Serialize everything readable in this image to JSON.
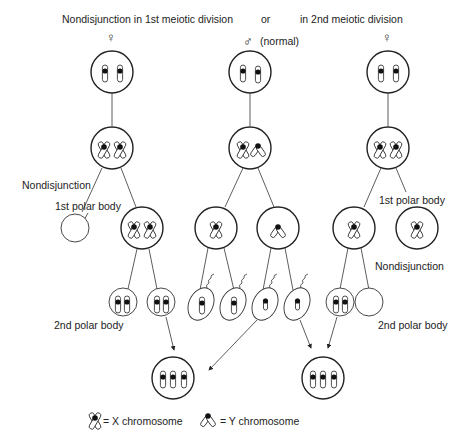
{
  "header": {
    "left_title": "Nondisjunction in 1st meiotic division",
    "or_label": "or",
    "right_title": "in 2nd meiotic division",
    "female_symbol_left": "♀",
    "male_symbol": "♂",
    "male_note": "(normal)",
    "female_symbol_right": "♀"
  },
  "labels": {
    "nondisjunction_left": "Nondisjunction",
    "first_polar_body_left": "1st polar body",
    "second_polar_body_left": "2nd polar body",
    "first_polar_body_right": "1st polar body",
    "nondisjunction_right": "Nondisjunction",
    "second_polar_body_right": "2nd polar body"
  },
  "legend": {
    "x_label": "= X chromosome",
    "y_label": "= Y chromosome"
  },
  "colors": {
    "line": "#222222",
    "background": "#ffffff"
  }
}
